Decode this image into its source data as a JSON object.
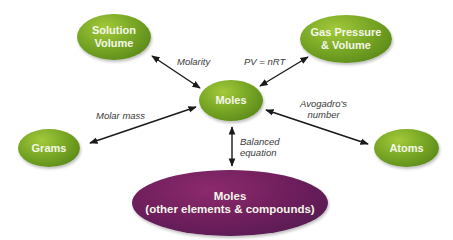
{
  "nodes": {
    "solution_volume": {
      "line1": "Solution",
      "line2": "Volume"
    },
    "gas": {
      "line1": "Gas Pressure",
      "line2": "& Volume"
    },
    "moles": {
      "label": "Moles"
    },
    "grams": {
      "label": "Grams"
    },
    "atoms": {
      "label": "Atoms"
    },
    "moles_other": {
      "line1": "Moles",
      "line2": "(other elements & compounds)"
    }
  },
  "edges": {
    "molarity": "Molarity",
    "gas_law": "PV = nRT",
    "molar_mass": "Molar mass",
    "avogadro_1": "Avogadro's",
    "avogadro_2": "number",
    "balanced_1": "Balanced",
    "balanced_2": "equation"
  },
  "colors": {
    "green_node": "#78a725",
    "purple_node": "#6e1e5c",
    "arrow": "#1a1a1a"
  }
}
